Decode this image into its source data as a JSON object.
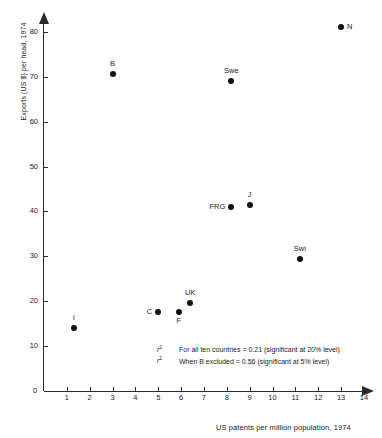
{
  "chart_data": {
    "type": "scatter",
    "title": "",
    "xlabel": "US patents per million population, 1974",
    "ylabel": "Exports (US $) per head, 1974",
    "xlim": [
      0,
      14
    ],
    "ylim": [
      0,
      84
    ],
    "grid": false,
    "legend": "none",
    "xticks": [
      "1",
      "2",
      "3",
      "4",
      "5",
      "6",
      "7",
      "8",
      "9",
      "10",
      "11",
      "12",
      "13",
      "14"
    ],
    "yticks": [
      "10",
      "20",
      "30",
      "40",
      "50",
      "60",
      "70",
      "80"
    ],
    "origin_label": "0",
    "points": [
      {
        "label": "N",
        "x": 13.0,
        "y": 81.0,
        "label_pos": "right"
      },
      {
        "label": "B",
        "x": 3.0,
        "y": 70.5,
        "label_pos": "above"
      },
      {
        "label": "Swe",
        "x": 8.2,
        "y": 69.0,
        "label_pos": "above"
      },
      {
        "label": "J",
        "x": 9.0,
        "y": 41.5,
        "label_pos": "above"
      },
      {
        "label": "FRG",
        "x": 8.2,
        "y": 41.0,
        "label_pos": "left"
      },
      {
        "label": "Swi",
        "x": 11.2,
        "y": 29.5,
        "label_pos": "above"
      },
      {
        "label": "UK",
        "x": 6.4,
        "y": 19.5,
        "label_pos": "above"
      },
      {
        "label": "F",
        "x": 5.9,
        "y": 17.5,
        "label_pos": "below"
      },
      {
        "label": "C",
        "x": 5.0,
        "y": 17.5,
        "label_pos": "left"
      },
      {
        "label": "I",
        "x": 1.3,
        "y": 14.0,
        "label_pos": "above"
      }
    ],
    "annotations": [
      {
        "symbol": "r",
        "exponent": "2",
        "text": "For all ten countries = 0.21 (significant at 20% level)"
      },
      {
        "symbol": "r",
        "exponent": "2",
        "text": "When B excluded = 0.56 (significant at 5% level)"
      }
    ]
  }
}
